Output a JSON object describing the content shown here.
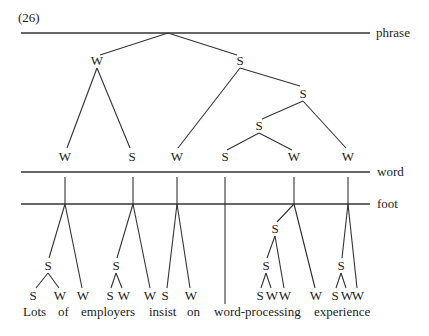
{
  "example_number": "(26)",
  "tiers": {
    "phrase": "phrase",
    "word": "word",
    "foot": "foot"
  },
  "phrase_tree": {
    "level1": [
      "W",
      "S"
    ],
    "level2_right": [
      "W",
      "S"
    ],
    "level3": [
      "S",
      "W"
    ],
    "level4": [
      "S",
      "W"
    ],
    "level1_left_children": [
      "W",
      "S"
    ]
  },
  "word_tier_nodes": [
    "W",
    "S",
    "W",
    "S",
    "W",
    "W"
  ],
  "foot_structure": {
    "lots_of": {
      "mid": "S",
      "leaves": [
        "S",
        "W"
      ],
      "extra": "W"
    },
    "employers": {
      "mid": "S",
      "leaves": [
        "S",
        "W"
      ],
      "extra": "W"
    },
    "insist_on": {
      "leaves": [
        "S",
        "W"
      ]
    },
    "word_processing": {
      "mid_top": "S",
      "mid": "S",
      "leaves": [
        "S",
        "W"
      ],
      "inner_w": "W",
      "extra": "W"
    },
    "experience": {
      "mid": "S",
      "leaves": [
        "S",
        "W"
      ],
      "extra": "W"
    }
  },
  "words": [
    "Lots",
    "of",
    "employers",
    "insist",
    "on",
    "word-processing",
    "experience"
  ]
}
